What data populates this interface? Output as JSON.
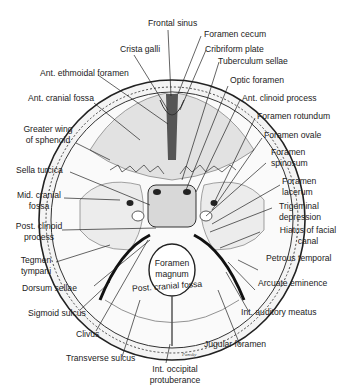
{
  "figure": {
    "signature": "Pansky"
  },
  "labels": {
    "frontal_sinus": "Frontal sinus",
    "foramen_cecum": "Foramen cecum",
    "crista_galli": "Crista galli",
    "cribriform_plate": "Cribriform plate",
    "tuberculum_sellae": "Tuberculum sellae",
    "ant_ethmoidal_foramen": "Ant. ethmoidal foramen",
    "optic_foramen": "Optic foramen",
    "ant_cranial_fossa": "Ant. cranial fossa",
    "ant_clinoid_process": "Ant. clinoid process",
    "foramen_rotundum": "Foramen rotundum",
    "greater_wing_1": "Greater wing",
    "greater_wing_2": "of sphenoid",
    "foramen_ovale": "Foramen ovale",
    "foramen_spinosum_1": "Foramen",
    "foramen_spinosum_2": "spinosum",
    "sella_turcica": "Sella turcica",
    "foramen_lacerum_1": "Foramen",
    "foramen_lacerum_2": "lacerum",
    "mid_cranial_fossa_1": "Mid. cranial",
    "mid_cranial_fossa_2": "fossa",
    "trigeminal_depression_1": "Trigeminal",
    "trigeminal_depression_2": "depression",
    "post_clinoid_process_1": "Post. clinoid",
    "post_clinoid_process_2": "process",
    "hiatus_facial_canal_1": "Hiatus of facial",
    "hiatus_facial_canal_2": "canal",
    "tegmen_tympani_1": "Tegmen",
    "tegmen_tympani_2": "tympani",
    "foramen_magnum_1": "Foramen",
    "foramen_magnum_2": "magnum",
    "petrous_temporal": "Petrous temporal",
    "dorsum_sellae": "Dorsum sellae",
    "post_cranial_fossa": "Post. cranial fossa",
    "arcuate_eminence": "Arcuate eminence",
    "sigmoid_sulcus": "Sigmoid sulcus",
    "int_auditory_meatus": "Int. auditory meatus",
    "clivus": "Clivus",
    "jugular_foramen": "Jugular foramen",
    "transverse_sulcus": "Transverse sulcus",
    "int_occipital_protuberance_1": "Int. occipital",
    "int_occipital_protuberance_2": "protuberance"
  }
}
